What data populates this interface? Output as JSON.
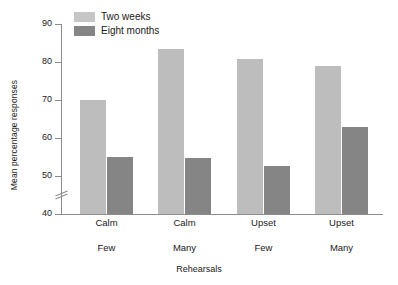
{
  "chart_data": {
    "type": "bar",
    "title": "",
    "xlabel": "Rehearsals",
    "ylabel": "Mean percentage responses",
    "ylim": [
      40,
      90
    ],
    "yticks": [
      40,
      50,
      60,
      70,
      80,
      90
    ],
    "axis_break": true,
    "axis_break_between": [
      40,
      50
    ],
    "grid": false,
    "legend_position": "top-left",
    "categories": [
      "Calm",
      "Calm",
      "Upset",
      "Upset"
    ],
    "group_labels": [
      "Few",
      "Many",
      "Few",
      "Many"
    ],
    "series": [
      {
        "name": "Two weeks",
        "color": "#bdbdbd",
        "values": [
          70,
          83.5,
          80.8,
          79
        ]
      },
      {
        "name": "Eight months",
        "color": "#858585",
        "values": [
          55,
          54.8,
          52.6,
          62.8
        ]
      }
    ]
  },
  "legend": {
    "items": [
      {
        "label": "Two weeks",
        "swatch": "legend-swatch-two-weeks"
      },
      {
        "label": "Eight months",
        "swatch": "legend-swatch-eight-months"
      }
    ]
  },
  "axes": {
    "y_title": "Mean percentage responses",
    "x_title": "Rehearsals",
    "y_tick_labels": [
      "90",
      "80",
      "70",
      "60",
      "50",
      "40"
    ]
  }
}
